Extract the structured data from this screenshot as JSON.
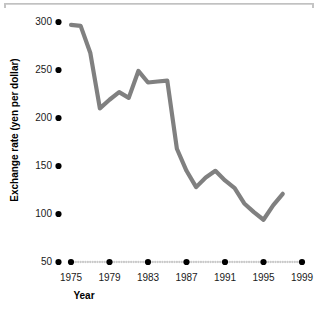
{
  "chart_data": {
    "type": "line",
    "title": "",
    "xlabel": "Year",
    "ylabel": "Exchange rate (yen per dollar)",
    "xlim": [
      1974,
      2000
    ],
    "ylim": [
      50,
      300
    ],
    "grid": false,
    "legend": "none",
    "line_color": "#808080",
    "marker_color": "#000000",
    "y_ticks": [
      300,
      250,
      200,
      150,
      100,
      50
    ],
    "y_tick_labels": [
      "300",
      "250",
      "200",
      "150",
      "100",
      "50"
    ],
    "x_ticks": [
      1975,
      1979,
      1983,
      1987,
      1991,
      1995,
      1999
    ],
    "x_tick_labels": [
      "1975",
      "1979",
      "1983",
      "1987",
      "1991",
      "1995",
      "1999"
    ],
    "x_minor_ticks": [
      1976,
      1977,
      1978,
      1980,
      1981,
      1982,
      1984,
      1985,
      1986,
      1988,
      1989,
      1990,
      1992,
      1993,
      1994,
      1996,
      1997,
      1998
    ],
    "series": [
      {
        "name": "Exchange rate",
        "x": [
          1975,
          1976,
          1977,
          1978,
          1979,
          1980,
          1981,
          1982,
          1983,
          1984,
          1985,
          1986,
          1987,
          1988,
          1989,
          1990,
          1991,
          1992,
          1993,
          1994,
          1995,
          1996,
          1997
        ],
        "values": [
          297,
          296,
          268,
          210,
          219,
          227,
          221,
          249,
          237,
          238,
          239,
          168,
          145,
          128,
          138,
          145,
          135,
          127,
          111,
          102,
          94,
          109,
          121
        ]
      }
    ]
  },
  "axes": {
    "y_axis_name": "exchange-rate-axis",
    "x_axis_name": "year-axis"
  }
}
